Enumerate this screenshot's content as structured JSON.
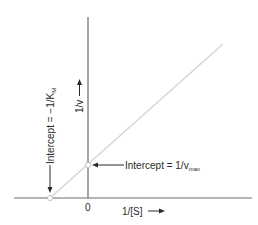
{
  "diagram": {
    "x_axis": {
      "label": "1/[S]",
      "arrow": "right-arrow",
      "origin_label": "0"
    },
    "y_axis": {
      "label": "1/v",
      "arrow": "up-arrow"
    },
    "annotations": {
      "y_intercept": {
        "text": "Intercept = 1/v",
        "subscript": "max"
      },
      "x_intercept": {
        "text": "Intercept = −1/K",
        "subscript": "M"
      }
    },
    "colors": {
      "axis": "#6a6a6a",
      "line": "#d0d0d0",
      "text": "#2a2a2a",
      "marker": "#ffffff"
    }
  }
}
